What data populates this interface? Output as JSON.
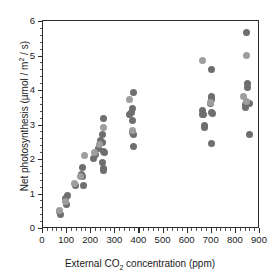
{
  "chart_data": {
    "type": "scatter",
    "title": "",
    "xlabel": "External CO2 concentration (ppm)",
    "ylabel": "Net photosynthesis (umol / m2 / s)",
    "xlim": [
      0,
      900
    ],
    "ylim": [
      0,
      6
    ],
    "xticks": [
      0,
      100,
      200,
      300,
      400,
      500,
      600,
      700,
      800,
      900
    ],
    "yticks": [
      0,
      1,
      2,
      3,
      4,
      5,
      6
    ],
    "x_minor_step": 20,
    "y_minor_step": 0.2,
    "grid": false,
    "legend": "none",
    "marker": "filled-circle",
    "series": [
      {
        "name": "dark-gray",
        "color": "#6e6e6e",
        "points": [
          [
            70,
            0.48
          ],
          [
            72,
            0.4
          ],
          [
            95,
            0.86
          ],
          [
            98,
            0.68
          ],
          [
            100,
            0.95
          ],
          [
            135,
            1.22
          ],
          [
            158,
            1.55
          ],
          [
            162,
            1.75
          ],
          [
            165,
            1.48
          ],
          [
            170,
            1.22
          ],
          [
            210,
            2.02
          ],
          [
            218,
            2.12
          ],
          [
            230,
            2.3
          ],
          [
            240,
            2.55
          ],
          [
            245,
            2.48
          ],
          [
            248,
            1.9
          ],
          [
            250,
            1.72
          ],
          [
            252,
            1.68
          ],
          [
            250,
            2.22
          ],
          [
            255,
            2.18
          ],
          [
            252,
            3.18
          ],
          [
            248,
            2.72
          ],
          [
            360,
            3.28
          ],
          [
            368,
            3.35
          ],
          [
            370,
            3.45
          ],
          [
            372,
            3.12
          ],
          [
            375,
            3.94
          ],
          [
            372,
            2.78
          ],
          [
            374,
            2.7
          ],
          [
            376,
            2.36
          ],
          [
            660,
            3.28
          ],
          [
            662,
            3.42
          ],
          [
            665,
            3.3
          ],
          [
            668,
            2.9
          ],
          [
            670,
            2.98
          ],
          [
            695,
            3.62
          ],
          [
            698,
            3.72
          ],
          [
            700,
            3.8
          ],
          [
            700,
            3.35
          ],
          [
            702,
            3.32
          ],
          [
            700,
            4.58
          ],
          [
            700,
            2.45
          ],
          [
            838,
            3.58
          ],
          [
            840,
            3.48
          ],
          [
            845,
            5.68
          ],
          [
            848,
            4.18
          ],
          [
            850,
            4.08
          ],
          [
            855,
            3.6
          ],
          [
            858,
            2.72
          ]
        ]
      },
      {
        "name": "light-gray",
        "color": "#9e9e9e",
        "points": [
          [
            68,
            0.52
          ],
          [
            93,
            0.78
          ],
          [
            130,
            1.28
          ],
          [
            155,
            1.5
          ],
          [
            172,
            2.1
          ],
          [
            215,
            2.18
          ],
          [
            235,
            2.42
          ],
          [
            250,
            2.92
          ],
          [
            358,
            3.72
          ],
          [
            370,
            2.82
          ],
          [
            660,
            4.86
          ],
          [
            695,
            3.65
          ],
          [
            832,
            3.82
          ],
          [
            845,
            5.0
          ],
          [
            846,
            3.68
          ]
        ]
      }
    ]
  },
  "axis": {
    "x_tick_labels": [
      "0",
      "100",
      "200",
      "300",
      "400",
      "500",
      "600",
      "700",
      "800",
      "900"
    ],
    "y_tick_labels": [
      "0",
      "1",
      "2",
      "3",
      "4",
      "5",
      "6"
    ],
    "xlabel_parts": {
      "pre": "External CO",
      "sub": "2",
      "post": " concentration (ppm)"
    },
    "ylabel_parts": {
      "pre": "Net photosynthesis (µmol / m",
      "sup": "2",
      "post": " / s)"
    }
  },
  "colors": {
    "axis": "#2b2b2b",
    "background": "#ffffff",
    "series_dark": "#6e6e6e",
    "series_light": "#9e9e9e"
  }
}
